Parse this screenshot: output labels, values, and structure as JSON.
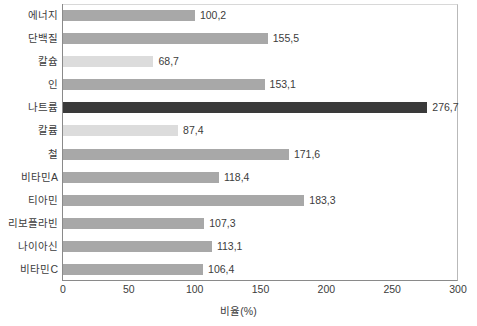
{
  "chart_data": {
    "type": "bar",
    "orientation": "horizontal",
    "title": "",
    "xlabel": "비율(%)",
    "ylabel": "",
    "xlim": [
      0,
      300
    ],
    "xticks": [
      "0",
      "50",
      "100",
      "150",
      "200",
      "250",
      "300"
    ],
    "grid": false,
    "legend": "none",
    "categories": [
      "에너지",
      "단백질",
      "칼슘",
      "인",
      "나트륨",
      "칼륨",
      "철",
      "비타민A",
      "티아민",
      "리보플라빈",
      "나이아신",
      "비타민C"
    ],
    "values": [
      100.2,
      155.5,
      68.7,
      153.1,
      276.7,
      87.4,
      171.6,
      118.4,
      183.3,
      107.3,
      113.1,
      106.4
    ],
    "value_labels": [
      "100,2",
      "155,5",
      "68,7",
      "153,1",
      "276,7",
      "87,4",
      "171,6",
      "118,4",
      "183,3",
      "107,3",
      "113,1",
      "106,4"
    ],
    "bar_styles": [
      "normal",
      "normal",
      "light",
      "normal",
      "dark",
      "light",
      "normal",
      "normal",
      "normal",
      "normal",
      "normal",
      "normal"
    ],
    "colors": {
      "bar_normal": "#a8a8a8",
      "bar_light": "#dcdcdc",
      "bar_dark": "#3a3a3a",
      "axis": "#8a8a8a",
      "text": "#3c3c3c",
      "background": "#ffffff"
    }
  }
}
